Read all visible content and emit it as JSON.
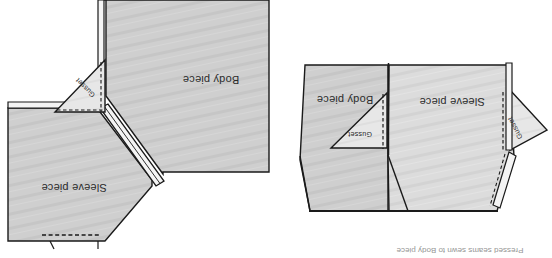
{
  "figure": {
    "orientation_note": "upside-down",
    "background_color": "#ffffff",
    "ink_color": "#1a1a1a",
    "fabric_fill": "#c9c9c9",
    "fabric_fill_light": "#dddddd",
    "gusset_fill": "#e6e6e6",
    "seam_fill": "#f2f2f2"
  },
  "panels": [
    {
      "id": "left-panel",
      "name": "gusset-pinned-view",
      "labels": {
        "body": "Body piece",
        "sleeve": "Sleeve piece",
        "gusset": "Gusset"
      },
      "caption": ""
    },
    {
      "id": "right-panel",
      "name": "gusset-sewn-flat-view",
      "labels": {
        "body": "Body piece",
        "sleeve": "Sleeve piece",
        "gusset": "Gusset"
      },
      "caption": "Pressed seams sewn to Body piece"
    }
  ],
  "legend": {
    "solid_line": "stitching / cut edge",
    "dashed_line": "fold or seam line"
  }
}
